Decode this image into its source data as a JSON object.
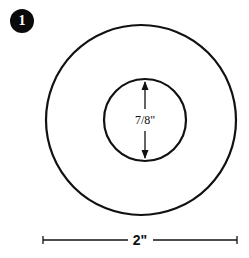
{
  "step": {
    "number": "1"
  },
  "diagram": {
    "inner_label": "7/8\"",
    "width_label": "2\"",
    "outer_circle": {
      "cx": 141,
      "cy": 120,
      "r": 95
    },
    "inner_circle": {
      "cx": 145,
      "cy": 120,
      "r": 41
    },
    "stroke_color": "#111111"
  }
}
